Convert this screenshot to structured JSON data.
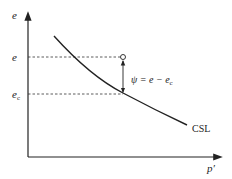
{
  "diagram": {
    "y_axis_label": "e",
    "x_axis_label": "p′",
    "tick_e": "e",
    "tick_ec_main": "e",
    "tick_ec_sub": "c",
    "curve_label": "CSL",
    "psi_label_lhs": "ψ = e − e",
    "psi_label_sub": "c"
  }
}
